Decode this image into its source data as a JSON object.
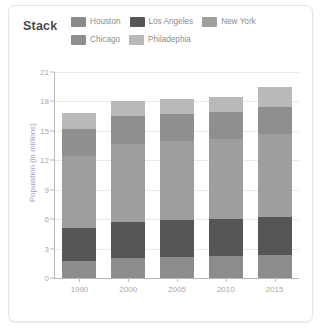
{
  "card": {
    "title": "Stack"
  },
  "legend": {
    "items": [
      {
        "label": "Houston",
        "color": "#8c8c8c"
      },
      {
        "label": "Los Angeles",
        "color": "#565656"
      },
      {
        "label": "New York",
        "color": "#9e9e9e"
      },
      {
        "label": "Chicago",
        "color": "#8f8f8f"
      },
      {
        "label": "Philadephia",
        "color": "#b9b9b9"
      }
    ]
  },
  "chart_data": {
    "type": "bar",
    "stacked": true,
    "title": "Stack",
    "xlabel": "",
    "ylabel": "Population (in millions)",
    "categories": [
      "1990",
      "2000",
      "2005",
      "2010",
      "2015"
    ],
    "ylim": [
      0,
      21
    ],
    "yticks": [
      0,
      3,
      6,
      9,
      12,
      15,
      18,
      21
    ],
    "grid": true,
    "legend_position": "top",
    "series": [
      {
        "name": "Houston",
        "color": "#8c8c8c",
        "values": [
          1.7,
          2.0,
          2.1,
          2.2,
          2.3
        ]
      },
      {
        "name": "Los Angeles",
        "color": "#565656",
        "values": [
          3.4,
          3.7,
          3.8,
          3.8,
          3.9
        ]
      },
      {
        "name": "New York",
        "color": "#9e9e9e",
        "values": [
          7.3,
          8.0,
          8.1,
          8.2,
          8.5
        ]
      },
      {
        "name": "Chicago",
        "color": "#8f8f8f",
        "values": [
          2.8,
          2.8,
          2.7,
          2.7,
          2.7
        ]
      },
      {
        "name": "Philadephia",
        "color": "#b9b9b9",
        "values": [
          1.6,
          1.5,
          1.6,
          1.6,
          2.1
        ]
      }
    ],
    "totals": [
      16.8,
      18.0,
      18.3,
      18.5,
      19.5
    ]
  }
}
